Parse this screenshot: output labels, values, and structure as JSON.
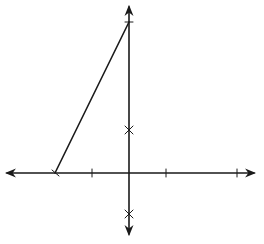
{
  "diagram": {
    "type": "coordinate-axes-with-segment",
    "background": "#ffffff",
    "stroke_color": "#1a1a1a",
    "x_axis": {
      "y": 173,
      "x_start": 3,
      "x_end": 258,
      "arrows": [
        "left",
        "right"
      ],
      "ticks": [
        92,
        166,
        237
      ]
    },
    "y_axis": {
      "x": 129,
      "y_start": 3,
      "y_end": 238,
      "arrows": [
        "up",
        "down"
      ],
      "ticks": [
        22
      ]
    },
    "x_marks": [
      {
        "x": 129,
        "y": 130
      },
      {
        "x": 129,
        "y": 214
      }
    ],
    "segment": {
      "x1": 55,
      "y1": 173,
      "x2": 129,
      "y2": 22
    },
    "endpoint_mark": {
      "x": 55,
      "y": 173
    }
  }
}
